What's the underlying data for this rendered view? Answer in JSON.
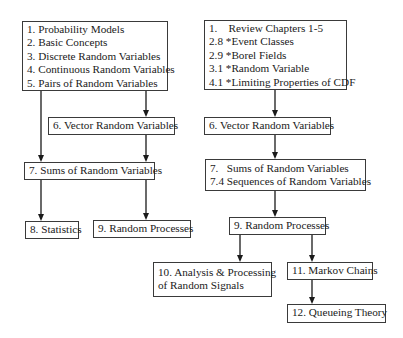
{
  "diagram": {
    "left_column": {
      "box_1_5": {
        "lines": [
          "1. Probability Models",
          "2. Basic Concepts",
          "3. Discrete Random Variables",
          "4. Continuous Random Variables",
          "5. Pairs of Random Variables"
        ]
      },
      "box_6": {
        "lines": [
          "6. Vector Random Variables"
        ]
      },
      "box_7": {
        "lines": [
          "7. Sums of Random Variables"
        ]
      },
      "box_8": {
        "lines": [
          "8. Statistics"
        ]
      },
      "box_9": {
        "lines": [
          "9. Random Processes"
        ]
      }
    },
    "right_column": {
      "box_review": {
        "lines": [
          "1.    Review Chapters 1-5",
          "2.8 *Event Classes",
          "2.9 *Borel Fields",
          "3.1 *Random Variable",
          "4.1 *Limiting Properties of CDF"
        ]
      },
      "box_6": {
        "lines": [
          "6. Vector Random Variables"
        ]
      },
      "box_7": {
        "lines": [
          "7.   Sums of Random Variables",
          "7.4 Sequences of Random Variables"
        ]
      },
      "box_9": {
        "lines": [
          "9. Random Processes"
        ]
      },
      "box_10": {
        "lines": [
          "10. Analysis & Processing",
          "of Random Signals"
        ]
      },
      "box_11": {
        "lines": [
          "11. Markov Chains"
        ]
      },
      "box_12": {
        "lines": [
          "12. Queueing Theory"
        ]
      }
    },
    "edges": [
      {
        "from": "L1-5",
        "to": "L7"
      },
      {
        "from": "L1-5",
        "to": "L6"
      },
      {
        "from": "L6",
        "to": "L7"
      },
      {
        "from": "L7",
        "to": "L8"
      },
      {
        "from": "L7",
        "to": "L9"
      },
      {
        "from": "R-review",
        "to": "R6"
      },
      {
        "from": "R6",
        "to": "R7"
      },
      {
        "from": "R7",
        "to": "R9"
      },
      {
        "from": "R9",
        "to": "R10"
      },
      {
        "from": "R9",
        "to": "R11"
      },
      {
        "from": "R11",
        "to": "R12"
      }
    ],
    "colors": {
      "line": "#1a1a1a",
      "border": "#3a3a3a",
      "background": "#ffffff"
    }
  }
}
